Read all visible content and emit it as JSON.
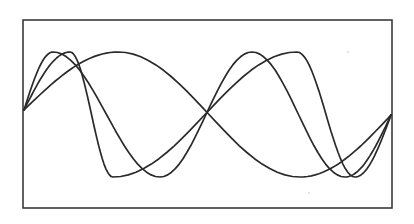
{
  "chart_data": {
    "type": "line",
    "title": "",
    "xlabel": "",
    "ylabel": "",
    "grid": false,
    "legend": null,
    "frame": {
      "x0": 23,
      "y0": 20,
      "x1": 392,
      "y1": 208
    },
    "start_point": [
      24,
      110
    ],
    "end_point": [
      391,
      115
    ],
    "amplitude_top_y": 52,
    "amplitude_bottom_y": 177,
    "series": [
      {
        "name": "wave-1-period",
        "periods": 1,
        "skew": 0.0,
        "peaks_x": [
          118
        ],
        "troughs_x": [
          300
        ]
      },
      {
        "name": "wave-2-periods-a",
        "periods": 2,
        "skew": 0.35,
        "peaks_x": [
          53,
          252
        ],
        "troughs_x": [
          160,
          345
        ]
      },
      {
        "name": "wave-2-periods-b",
        "periods": 2,
        "skew": -0.35,
        "peaks_x": [
          70,
          297
        ],
        "troughs_x": [
          113,
          355
        ]
      }
    ],
    "color": "#2a2a2a"
  }
}
